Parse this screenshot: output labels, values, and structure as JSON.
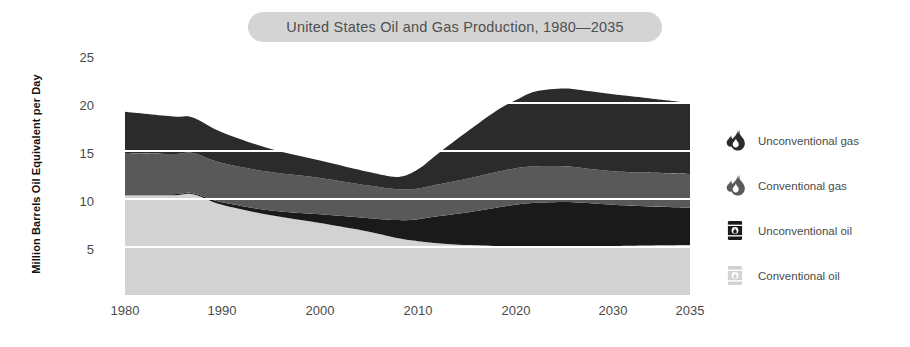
{
  "chart_data": {
    "type": "area",
    "stacked": true,
    "title": "United States Oil and Gas Production, 1980—2035",
    "xlabel": "",
    "ylabel": "Million Barrels Oil Equivalent per Day",
    "xlim": [
      1980,
      2035
    ],
    "ylim": [
      0,
      25
    ],
    "yticks": [
      5,
      10,
      15,
      20,
      25
    ],
    "ytick_labels": [
      "5",
      "10",
      "15",
      "20",
      "25"
    ],
    "xticks": [
      1980,
      1990,
      2000,
      2010,
      2020,
      2030,
      2035
    ],
    "xtick_labels": [
      "1980",
      "1990",
      "2000",
      "2010",
      "2020",
      "2030",
      "2035"
    ],
    "grid": "horizontal-white",
    "legend_position": "right",
    "x": [
      1980,
      1985,
      1987,
      1990,
      1995,
      2000,
      2005,
      2008,
      2010,
      2012,
      2015,
      2018,
      2020,
      2022,
      2025,
      2027,
      2030,
      2032,
      2035
    ],
    "series": [
      {
        "name": "Conventional oil",
        "color": "#d2d2d2",
        "values": [
          10.4,
          10.4,
          10.5,
          9.4,
          8.3,
          7.5,
          6.6,
          5.9,
          5.6,
          5.4,
          5.2,
          5.1,
          5.1,
          5.1,
          5.1,
          5.1,
          5.1,
          5.15,
          5.2
        ]
      },
      {
        "name": "Unconventional oil",
        "color": "#1a1a1a",
        "values": [
          0.1,
          0.1,
          0.1,
          0.25,
          0.5,
          0.9,
          1.4,
          1.9,
          2.3,
          2.8,
          3.4,
          4.0,
          4.3,
          4.5,
          4.6,
          4.5,
          4.3,
          4.1,
          3.9
        ]
      },
      {
        "name": "Conventional gas",
        "color": "#595959",
        "values": [
          4.3,
          4.2,
          4.2,
          4.1,
          4.0,
          3.8,
          3.4,
          3.2,
          3.2,
          3.3,
          3.5,
          3.7,
          3.8,
          3.8,
          3.7,
          3.6,
          3.5,
          3.5,
          3.5
        ]
      },
      {
        "name": "Unconventional gas",
        "color": "#2b2b2b",
        "values": [
          4.3,
          3.9,
          3.7,
          3.2,
          2.4,
          1.8,
          1.4,
          1.3,
          2.0,
          3.2,
          4.9,
          6.4,
          7.1,
          7.8,
          8.1,
          8.1,
          8.0,
          7.8,
          7.4
        ]
      }
    ],
    "stack_order_bottom_to_top": [
      "Conventional oil",
      "Unconventional oil",
      "Conventional gas",
      "Unconventional gas"
    ],
    "totals": [
      19.1,
      18.6,
      18.5,
      16.95,
      15.2,
      14.0,
      12.8,
      12.3,
      13.1,
      14.7,
      17.0,
      19.2,
      20.3,
      21.2,
      21.5,
      21.3,
      20.9,
      20.55,
      20.0
    ]
  },
  "header": {
    "title": "United States Oil and Gas Production, 1980—2035",
    "pill_color": "#d4d4d4"
  },
  "axes": {
    "y_title": "Million Barrels Oil Equivalent per Day",
    "y_ticks": [
      "25",
      "20",
      "15",
      "10",
      "5"
    ],
    "x_ticks": [
      "1980",
      "1990",
      "2000",
      "2010",
      "2020",
      "2030",
      "2035"
    ]
  },
  "legend": {
    "items": [
      {
        "label": "Unconventional gas",
        "icon": "flame-icon",
        "color": "#2b2b2b"
      },
      {
        "label": "Conventional gas",
        "icon": "flame-icon",
        "color": "#595959"
      },
      {
        "label": "Unconventional oil",
        "icon": "oil-barrel-icon",
        "color": "#1a1a1a"
      },
      {
        "label": "Conventional oil",
        "icon": "oil-barrel-icon",
        "color": "#d2d2d2"
      }
    ]
  }
}
